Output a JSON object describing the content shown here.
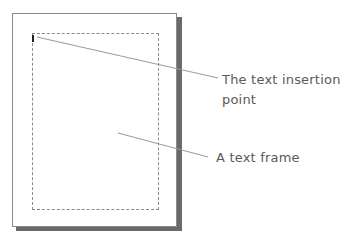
{
  "diagram": {
    "callouts": [
      {
        "line1": "The text insertion",
        "line2": "point"
      },
      {
        "line1": "A text frame"
      }
    ],
    "colors": {
      "page_border": "#8a8a8a",
      "shadow": "#6a6a6a",
      "leader_line": "#9a9a9a",
      "label_text": "#5a5a5a",
      "cursor": "#222222"
    }
  }
}
